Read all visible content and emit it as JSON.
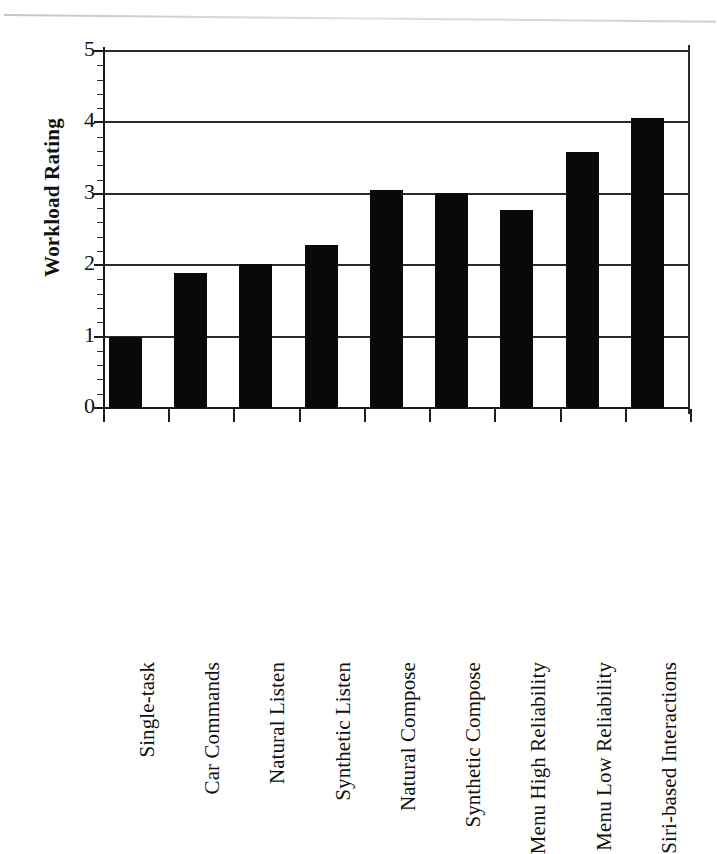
{
  "chart_data": {
    "type": "bar",
    "title": "",
    "subtitle": "",
    "xlabel": "",
    "ylabel": "Workload Rating",
    "ylim": [
      0,
      5
    ],
    "ytick_labels": [
      "0",
      "1",
      "2",
      "3",
      "4",
      "5"
    ],
    "ytick_values": [
      0,
      1,
      2,
      3,
      4,
      5
    ],
    "minor_ticks_per_interval": 4,
    "grid": "horizontal",
    "legend": "none",
    "bar_color": "#090909",
    "axis_color": "#1a1a1a",
    "background_color": "#ffffff",
    "categories": [
      "Single-task",
      "Car Commands",
      "Natural Listen",
      "Synthetic Listen",
      "Natural Compose",
      "Synthetic Compose",
      "Menu High Reliability",
      "Menu Low Reliability",
      "Siri-based Interactions"
    ],
    "values": [
      1.0,
      1.89,
      2.02,
      2.28,
      3.05,
      3.01,
      2.77,
      3.58,
      4.06
    ],
    "series": [
      {
        "name": "Workload Rating",
        "values": [
          1.0,
          1.89,
          2.02,
          2.28,
          3.05,
          3.01,
          2.77,
          3.58,
          4.06
        ]
      }
    ]
  },
  "figure": {
    "y_axis_title": "Workload Rating"
  }
}
